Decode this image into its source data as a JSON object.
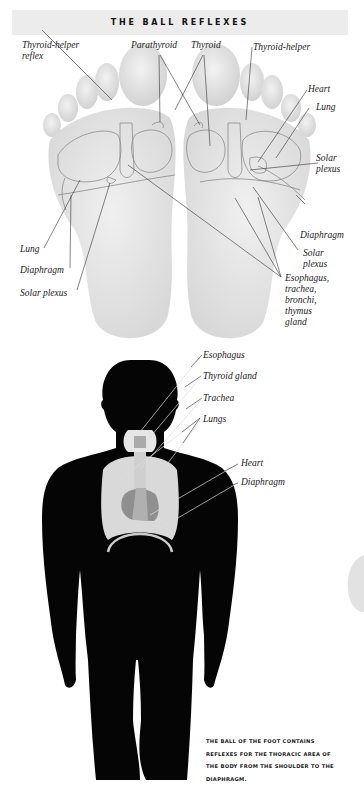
{
  "header": {
    "title": "THE BALL REFLEXES"
  },
  "foot_labels": {
    "thyroid_helper_reflex": "Thyroid-helper\nreflex",
    "parathyroid": "Parathyroid",
    "thyroid": "Thyroid",
    "thyroid_helper": "Thyroid-helper",
    "heart": "Heart",
    "lung_right": "Lung",
    "solar_plexus_right_top": "Solar\nplexus",
    "diaphragm_right": "Diaphragm",
    "solar_plexus_right_bottom": "Solar\nplexus",
    "esophagus_group": "Esophagus,\ntrachea,\nbronchi,\nthymus\ngland",
    "lung_left": "Lung",
    "diaphragm_left": "Diaphragm",
    "solar_plexus_left": "Solar plexus"
  },
  "body_labels": {
    "esophagus": "Esophagus",
    "thyroid_gland": "Thyroid gland",
    "trachea": "Trachea",
    "lungs": "Lungs",
    "heart": "Heart",
    "diaphragm": "Diaphragm"
  },
  "caption": {
    "line1": "THE BALL OF THE FOOT CONTAINS",
    "line2": "REFLEXES FOR THE THORACIC AREA OF",
    "line3": "THE BODY FROM THE SHOULDER TO THE",
    "line4": "DIAPHRAGM."
  },
  "colors": {
    "header_bg": "#ececec",
    "foot": "#e6e6e6",
    "silhouette": "#050505",
    "organ_light": "#d9d9d9",
    "organ_mid": "#b5b5b5",
    "organ_dark": "#8f8f8f"
  }
}
